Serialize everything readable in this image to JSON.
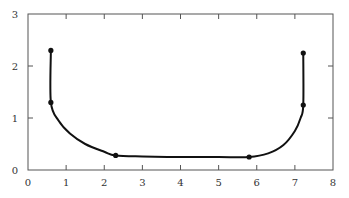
{
  "chart_data": {
    "type": "line",
    "title": "",
    "xlabel": "",
    "ylabel": "",
    "xlim": [
      0,
      8
    ],
    "ylim": [
      0,
      3
    ],
    "grid": false,
    "legend": null,
    "x_ticks": [
      "0",
      "1",
      "2",
      "3",
      "4",
      "5",
      "6",
      "7",
      "8"
    ],
    "y_ticks": [
      "0",
      "1",
      "2",
      "3"
    ],
    "series": [
      {
        "name": "curve",
        "color": "#111111",
        "curve_points": [
          [
            0.6,
            2.3
          ],
          [
            0.6,
            1.3
          ],
          [
            0.8,
            0.95
          ],
          [
            1.1,
            0.7
          ],
          [
            1.5,
            0.5
          ],
          [
            2.0,
            0.35
          ],
          [
            2.3,
            0.28
          ],
          [
            3.0,
            0.26
          ],
          [
            4.0,
            0.25
          ],
          [
            5.0,
            0.25
          ],
          [
            5.8,
            0.25
          ],
          [
            6.3,
            0.32
          ],
          [
            6.7,
            0.48
          ],
          [
            7.0,
            0.75
          ],
          [
            7.15,
            1.0
          ],
          [
            7.22,
            1.25
          ],
          [
            7.22,
            2.25
          ]
        ],
        "markers": [
          {
            "x": 0.6,
            "y": 2.3
          },
          {
            "x": 0.6,
            "y": 1.3
          },
          {
            "x": 2.3,
            "y": 0.28
          },
          {
            "x": 5.8,
            "y": 0.25
          },
          {
            "x": 7.22,
            "y": 1.25
          },
          {
            "x": 7.22,
            "y": 2.25
          }
        ]
      }
    ]
  }
}
